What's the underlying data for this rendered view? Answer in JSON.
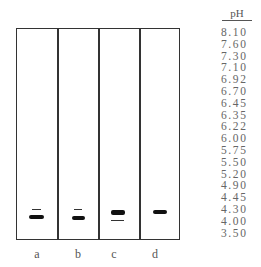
{
  "gel": {
    "lanes": [
      {
        "label": "a",
        "bands": [
          {
            "type": "thin",
            "x": 32,
            "y": 209,
            "w": 9
          },
          {
            "type": "thick",
            "x": 29,
            "y": 215,
            "w": 15,
            "h": 4
          }
        ]
      },
      {
        "label": "b",
        "bands": [
          {
            "type": "thin",
            "x": 74,
            "y": 209,
            "w": 8
          },
          {
            "type": "thick",
            "x": 72,
            "y": 216,
            "w": 13,
            "h": 4
          }
        ]
      },
      {
        "label": "c",
        "bands": [
          {
            "type": "thick",
            "x": 111,
            "y": 210,
            "w": 14,
            "h": 5
          },
          {
            "type": "thin",
            "x": 111,
            "y": 220,
            "w": 13
          }
        ]
      },
      {
        "label": "d",
        "bands": [
          {
            "type": "thick",
            "x": 153,
            "y": 210,
            "w": 14,
            "h": 4
          }
        ]
      }
    ]
  },
  "ph_scale": {
    "header": "pH",
    "values": [
      "8.10",
      "7.60",
      "7.30",
      "7.10",
      "6.92",
      "6.70",
      "6.45",
      "6.35",
      "6.22",
      "6.00",
      "5.75",
      "5.50",
      "5.20",
      "4.90",
      "4.45",
      "4.30",
      "4.00",
      "3.50"
    ]
  },
  "labels": {
    "a": "a",
    "b": "b",
    "c": "c",
    "d": "d"
  }
}
